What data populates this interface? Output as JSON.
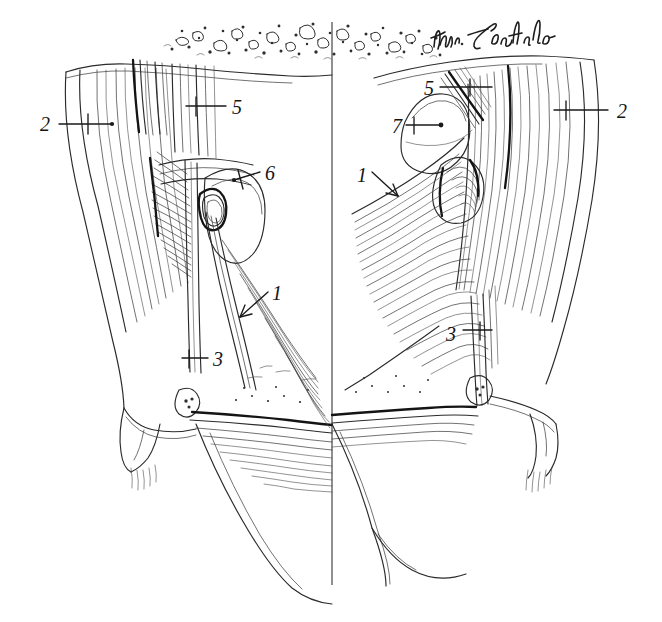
{
  "figure": {
    "medium": "pen-and-ink line drawing",
    "background_color": "#ffffff",
    "ink_color": "#2b2b2b",
    "width": 662,
    "height": 622,
    "signature": "Wm Loechel",
    "midline_label": "vertical midline divider"
  },
  "labels": [
    {
      "id": "left-2",
      "text": "2",
      "x": 40,
      "y": 129,
      "side": "left",
      "leader": "horizontal line with cross tick pointing right into the lateral muscle mass"
    },
    {
      "id": "left-5",
      "text": "5",
      "x": 232,
      "y": 112,
      "side": "left",
      "leader": "horizontal line with cross tick pointing left"
    },
    {
      "id": "left-6",
      "text": "6",
      "x": 265,
      "y": 180,
      "side": "left",
      "leader": "short line with cross tick pointing down-left onto the rounded bulb"
    },
    {
      "id": "left-1",
      "text": "1",
      "x": 272,
      "y": 298,
      "side": "left",
      "leader": "diagonal arrow pointing down-left onto the fibre band"
    },
    {
      "id": "left-3",
      "text": "3",
      "x": 213,
      "y": 364,
      "side": "left",
      "leader": "horizontal line with cross tick pointing left onto the narrow band"
    },
    {
      "id": "right-5",
      "text": "5",
      "x": 424,
      "y": 93,
      "side": "right",
      "leader": "horizontal line with cross tick pointing right"
    },
    {
      "id": "right-7",
      "text": "7",
      "x": 392,
      "y": 131,
      "side": "right",
      "leader": "horizontal line ending in a dot on the ovoid body"
    },
    {
      "id": "right-2",
      "text": "2",
      "x": 617,
      "y": 116,
      "side": "right",
      "leader": "horizontal line with cross tick pointing left into the lateral muscle mass"
    },
    {
      "id": "right-1",
      "text": "1",
      "x": 357,
      "y": 180,
      "side": "right",
      "leader": "diagonal arrow pointing down-right onto the fan of fibres"
    },
    {
      "id": "right-3",
      "text": "3",
      "x": 446,
      "y": 339,
      "side": "right",
      "leader": "horizontal line with cross tick pointing right onto the narrow band"
    }
  ],
  "legend_numbers": [
    "1",
    "2",
    "3",
    "5",
    "6",
    "7"
  ],
  "regions": {
    "top_texture": "stippled adipose / fat tissue band across the superior border",
    "left_half": "left side shows superficial dissection with rounded bulb (6) and descending band (1)",
    "right_half": "right side shows deeper dissection with ovoid body (7) and fan-shaped muscle (1)"
  }
}
